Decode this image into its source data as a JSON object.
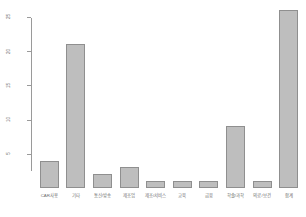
{
  "chart_data": {
    "type": "bar",
    "title": "",
    "subtitle": "",
    "xlabel": "",
    "ylabel": "",
    "categories": [
      "CAR사용",
      "기타",
      "통신/방송",
      "제조업",
      "제조/서비스",
      "교육",
      "금융",
      "학술/과학",
      "의료/보건",
      "합계"
    ],
    "values": [
      4,
      21,
      2,
      3,
      1,
      1,
      1,
      9,
      1,
      26
    ],
    "ylim": [
      0,
      26
    ],
    "yticks": [
      5,
      10,
      15,
      20,
      25
    ],
    "ytick_labels": [
      "5",
      "10",
      "15",
      "20",
      "25"
    ],
    "grid": false,
    "legend": null,
    "bar_color": "#bebebe",
    "bar_border_color": "#8f8f8f",
    "axis_color": "#9a9a9a",
    "text_color": "#6e6e6e",
    "background": "#ffffff"
  }
}
